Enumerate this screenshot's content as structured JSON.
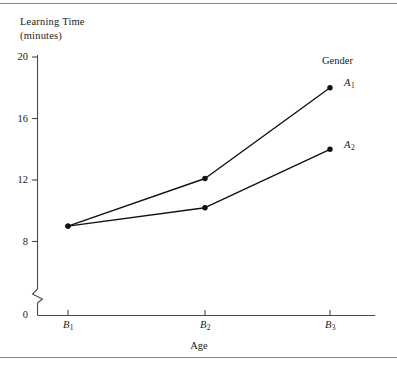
{
  "chart_data": {
    "type": "line",
    "title": "",
    "xlabel": "Age",
    "ylabel_line1": "Learning Time",
    "ylabel_line2": "(minutes)",
    "categories": [
      "B₁",
      "B₂",
      "B₃"
    ],
    "x_tick_labels": [
      {
        "base": "B",
        "sub": "1"
      },
      {
        "base": "B",
        "sub": "2"
      },
      {
        "base": "B",
        "sub": "3"
      }
    ],
    "y_tick_labels": [
      "0",
      "8",
      "12",
      "16",
      "20"
    ],
    "y_ticks": [
      0,
      8,
      12,
      16,
      20
    ],
    "ylim": [
      8,
      20
    ],
    "y_axis_break": true,
    "y_axis_break_note": "zigzag break between 0 and 8",
    "grid": false,
    "legend_title": "Gender",
    "legend_position": "right-inline",
    "series": [
      {
        "name": "A₁",
        "label_base": "A",
        "label_sub": "1",
        "values": [
          9.0,
          12.1,
          18.0
        ],
        "marker": "filled-circle",
        "color": "#111111"
      },
      {
        "name": "A₂",
        "label_base": "A",
        "label_sub": "2",
        "values": [
          9.0,
          10.2,
          14.0
        ],
        "marker": "filled-circle",
        "color": "#111111"
      }
    ]
  },
  "figure": {
    "axis_color": "#4a4a4a",
    "line_color": "#111111",
    "rule_color": "#8a8a8a",
    "background": "#ffffff"
  }
}
